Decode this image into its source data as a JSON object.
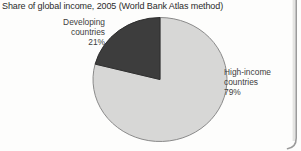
{
  "chart_data": {
    "type": "pie",
    "title": "Share of global income, 2005 (World Bank Atlas method)",
    "unit": "%",
    "start_angle_deg": 90,
    "direction": "clockwise",
    "legend": "none",
    "labels_position": "outside",
    "slices": [
      {
        "name": "High-income countries",
        "value": 79,
        "color": "#d7d7d6",
        "stroke": "#8a8a8a",
        "label_lines": [
          "High-income",
          "countries",
          "79%"
        ]
      },
      {
        "name": "Developing countries",
        "value": 21,
        "color": "#3d3d3d",
        "stroke": "#2e2e2e",
        "label_lines": [
          "Developing",
          "countries",
          "21%"
        ]
      }
    ]
  },
  "decor": {
    "page_edge_color": "#9b9b9b",
    "page_edge_shadow_color": "#e4e4e2"
  }
}
